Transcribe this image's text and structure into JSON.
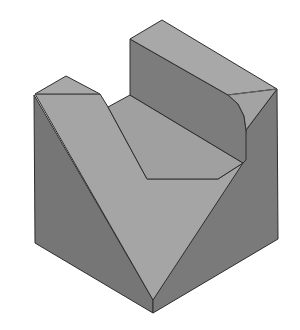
{
  "diagram": {
    "type": "isometric-solid",
    "colors": {
      "background": "#ffffff",
      "top_light": "#a6a6a6",
      "slope_light": "#a4a4a4",
      "side_dark": "#7a7a7a",
      "side_darker": "#747474",
      "inner_wall": "#808080",
      "floor": "#a2a2a2",
      "edge": "#2e2e2e"
    },
    "faces": [
      {
        "name": "back-rib-top",
        "points": "130,39 162,20 277,89 246,89 228,95 130,39"
      },
      {
        "name": "back-rib-front-wall",
        "points": "130,39 228,95 236,103 244,116 246,130 246,163 218,179 130,128 130,95"
      },
      {
        "name": "back-rib-right-chamfer",
        "points": "228,95 277,89 246,130 244,116 236,103"
      },
      {
        "name": "slot-floor",
        "points": "108,107 130,95 218,146 243,163 218,179 147,179"
      },
      {
        "name": "left-pillar-top",
        "points": "35,94 66,76 100,94"
      },
      {
        "name": "v-notch-left-slope",
        "points": "35,94 100,94 108,107 147,179 218,179 243,163 153,300"
      },
      {
        "name": "left-side-face",
        "points": "35,94 153,300 153,313 34,243"
      },
      {
        "name": "right-side-face",
        "points": "277,89 278,239 153,313 153,300 243,163 246,163 246,130"
      }
    ]
  }
}
